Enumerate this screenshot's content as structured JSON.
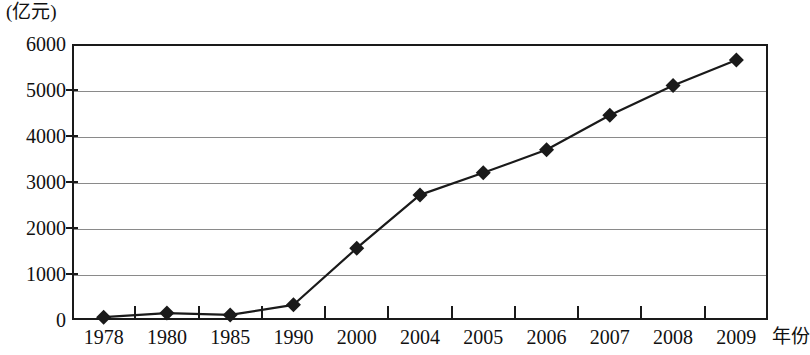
{
  "chart_data": {
    "type": "line",
    "title": "",
    "subtitle": "",
    "xlabel": "年份",
    "ylabel": "(亿元)",
    "categories": [
      "1978",
      "1980",
      "1985",
      "1990",
      "2000",
      "2004",
      "2005",
      "2006",
      "2007",
      "2008",
      "2009"
    ],
    "values": [
      60,
      150,
      110,
      330,
      1560,
      2720,
      3200,
      3700,
      4450,
      5100,
      5650
    ],
    "series": [
      {
        "name": "",
        "values": [
          60,
          150,
          110,
          330,
          1560,
          2720,
          3200,
          3700,
          4450,
          5100,
          5650
        ]
      }
    ],
    "ylim": [
      0,
      6000
    ],
    "yticks": [
      0,
      1000,
      2000,
      3000,
      4000,
      5000,
      6000
    ],
    "ytick_labels": [
      "0",
      "1000",
      "2000",
      "3000",
      "4000",
      "5000",
      "6000"
    ],
    "grid": true,
    "legend": "none",
    "marker": "diamond",
    "line_color": "#1a1a1a",
    "marker_color": "#1a1a1a",
    "grid_color": "#8a8a8a",
    "frame_color": "#1a1a1a"
  },
  "axis": {
    "y_unit_caption": "(亿元)",
    "x_axis_title": "年份"
  }
}
